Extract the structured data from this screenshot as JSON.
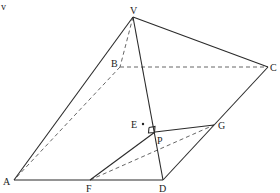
{
  "diagram": {
    "type": "geometry-figure",
    "corner_mark": "v",
    "points": {
      "V": {
        "label": "V",
        "x": 133,
        "y": 17
      },
      "A": {
        "label": "A",
        "x": 14,
        "y": 180
      },
      "B": {
        "label": "B",
        "x": 120,
        "y": 67
      },
      "C": {
        "label": "C",
        "x": 268,
        "y": 67
      },
      "D": {
        "label": "D",
        "x": 163,
        "y": 180
      },
      "E": {
        "label": "E",
        "x": 143,
        "y": 124
      },
      "F": {
        "label": "F",
        "x": 90,
        "y": 180
      },
      "G": {
        "label": "G",
        "x": 214,
        "y": 125
      },
      "P": {
        "label": "P",
        "x": 155,
        "y": 132
      }
    },
    "solid_edges": [
      "VA",
      "VC",
      "VD",
      "AD",
      "DC",
      "FP",
      "PG",
      "FD",
      "DG"
    ],
    "dashed_edges": [
      "VB",
      "BA",
      "BC",
      "FG"
    ],
    "right_angle_at": "P",
    "colors": {
      "line": "#2a2a2a",
      "dashed": "#555555",
      "background": "#ffffff"
    }
  }
}
